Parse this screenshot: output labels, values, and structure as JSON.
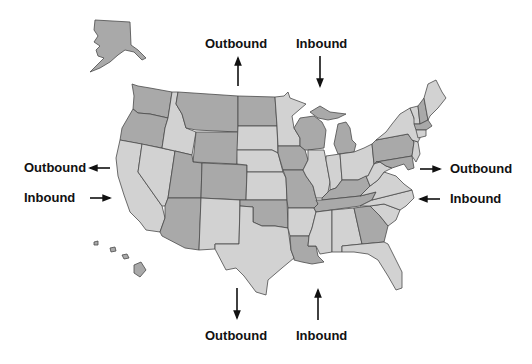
{
  "map": {
    "title": "United States shipping direction map",
    "colors": {
      "dark": "#a9a9a9",
      "light": "#d2d2d2",
      "border": "#4a4a4a",
      "text": "#111111"
    },
    "states": [
      {
        "id": "AK",
        "name": "Alaska",
        "shade": "dark"
      },
      {
        "id": "HI",
        "name": "Hawaii",
        "shade": "dark"
      },
      {
        "id": "WA",
        "name": "Washington",
        "shade": "dark"
      },
      {
        "id": "OR",
        "name": "Oregon",
        "shade": "dark"
      },
      {
        "id": "CA",
        "name": "California",
        "shade": "light"
      },
      {
        "id": "NV",
        "name": "Nevada",
        "shade": "light"
      },
      {
        "id": "ID",
        "name": "Idaho",
        "shade": "light"
      },
      {
        "id": "MT",
        "name": "Montana",
        "shade": "dark"
      },
      {
        "id": "WY",
        "name": "Wyoming",
        "shade": "dark"
      },
      {
        "id": "UT",
        "name": "Utah",
        "shade": "dark"
      },
      {
        "id": "CO",
        "name": "Colorado",
        "shade": "dark"
      },
      {
        "id": "AZ",
        "name": "Arizona",
        "shade": "dark"
      },
      {
        "id": "NM",
        "name": "New Mexico",
        "shade": "light"
      },
      {
        "id": "ND",
        "name": "North Dakota",
        "shade": "dark"
      },
      {
        "id": "SD",
        "name": "South Dakota",
        "shade": "light"
      },
      {
        "id": "NE",
        "name": "Nebraska",
        "shade": "light"
      },
      {
        "id": "KS",
        "name": "Kansas",
        "shade": "light"
      },
      {
        "id": "OK",
        "name": "Oklahoma",
        "shade": "dark"
      },
      {
        "id": "TX",
        "name": "Texas",
        "shade": "light"
      },
      {
        "id": "MN",
        "name": "Minnesota",
        "shade": "light"
      },
      {
        "id": "IA",
        "name": "Iowa",
        "shade": "dark"
      },
      {
        "id": "MO",
        "name": "Missouri",
        "shade": "dark"
      },
      {
        "id": "AR",
        "name": "Arkansas",
        "shade": "light"
      },
      {
        "id": "LA",
        "name": "Louisiana",
        "shade": "dark"
      },
      {
        "id": "WI",
        "name": "Wisconsin",
        "shade": "dark"
      },
      {
        "id": "IL",
        "name": "Illinois",
        "shade": "light"
      },
      {
        "id": "MI",
        "name": "Michigan",
        "shade": "dark"
      },
      {
        "id": "IN",
        "name": "Indiana",
        "shade": "light"
      },
      {
        "id": "OH",
        "name": "Ohio",
        "shade": "light"
      },
      {
        "id": "KY",
        "name": "Kentucky",
        "shade": "dark"
      },
      {
        "id": "TN",
        "name": "Tennessee",
        "shade": "dark"
      },
      {
        "id": "MS",
        "name": "Mississippi",
        "shade": "light"
      },
      {
        "id": "AL",
        "name": "Alabama",
        "shade": "light"
      },
      {
        "id": "GA",
        "name": "Georgia",
        "shade": "dark"
      },
      {
        "id": "FL",
        "name": "Florida",
        "shade": "light"
      },
      {
        "id": "SC",
        "name": "South Carolina",
        "shade": "light"
      },
      {
        "id": "NC",
        "name": "North Carolina",
        "shade": "light"
      },
      {
        "id": "VA",
        "name": "Virginia",
        "shade": "light"
      },
      {
        "id": "WV",
        "name": "West Virginia",
        "shade": "light"
      },
      {
        "id": "PA",
        "name": "Pennsylvania",
        "shade": "dark"
      },
      {
        "id": "NY",
        "name": "New York",
        "shade": "light"
      },
      {
        "id": "MD",
        "name": "Maryland",
        "shade": "dark"
      },
      {
        "id": "NJ",
        "name": "New Jersey",
        "shade": "light"
      },
      {
        "id": "VT",
        "name": "Vermont",
        "shade": "light"
      },
      {
        "id": "NH",
        "name": "New Hampshire",
        "shade": "dark"
      },
      {
        "id": "ME",
        "name": "Maine",
        "shade": "light"
      },
      {
        "id": "MA",
        "name": "Massachusetts",
        "shade": "dark"
      },
      {
        "id": "CT",
        "name": "Connecticut",
        "shade": "light"
      }
    ]
  },
  "labels": {
    "top_outbound": "Outbound",
    "top_inbound": "Inbound",
    "left_outbound": "Outbound",
    "left_inbound": "Inbound",
    "right_outbound": "Outbound",
    "right_inbound": "Inbound",
    "bottom_outbound": "Outbound",
    "bottom_inbound": "Inbound"
  },
  "arrows": {
    "top_outbound": "up",
    "top_inbound": "down",
    "left_outbound": "left",
    "left_inbound": "right",
    "right_outbound": "right",
    "right_inbound": "left",
    "bottom_outbound": "down",
    "bottom_inbound": "up"
  }
}
